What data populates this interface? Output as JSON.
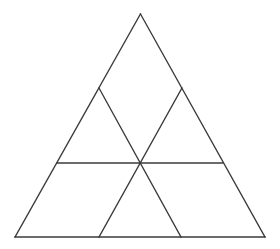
{
  "figure": {
    "background_color": "#ffffff",
    "line_color": "#3a3a3a",
    "line_width": 1.3,
    "canvas": {
      "width": 280,
      "height": 249
    },
    "points": {
      "apex": {
        "label": "A",
        "x": 140.5,
        "y": 14
      },
      "bottom_left": {
        "label": "B",
        "x": 15,
        "y": 237
      },
      "bottom_right": {
        "label": "C",
        "x": 265,
        "y": 237
      },
      "left_edge_upper": {
        "label": "D",
        "x": 99,
        "y": 88
      },
      "right_edge_upper": {
        "label": "E",
        "x": 182,
        "y": 88
      },
      "left_edge_mid": {
        "label": "F",
        "x": 57,
        "y": 163
      },
      "right_edge_mid": {
        "label": "G",
        "x": 223,
        "y": 163
      },
      "center": {
        "label": "H",
        "x": 141,
        "y": 163
      },
      "base_left_third": {
        "label": "I",
        "x": 99,
        "y": 237
      },
      "base_right_third": {
        "label": "J",
        "x": 181,
        "y": 237
      }
    },
    "outline": [
      {
        "name": "left-side",
        "from": "apex",
        "to": "bottom_left"
      },
      {
        "name": "right-side",
        "from": "apex",
        "to": "bottom_right"
      },
      {
        "name": "base",
        "from": "bottom_left",
        "to": "bottom_right"
      }
    ],
    "internal_lines": [
      {
        "name": "horizontal-midline",
        "from": "left_edge_mid",
        "to": "right_edge_mid"
      },
      {
        "name": "diagonal-left-down-right",
        "from": "left_edge_upper",
        "to": "base_right_third"
      },
      {
        "name": "diagonal-right-down-left",
        "from": "right_edge_upper",
        "to": "base_left_third"
      }
    ],
    "regions": [
      {
        "name": "top-triangle",
        "vertices": [
          "apex",
          "left_edge_upper",
          "right_edge_upper"
        ]
      },
      {
        "name": "upper-left-triangle",
        "vertices": [
          "left_edge_upper",
          "left_edge_mid",
          "center"
        ]
      },
      {
        "name": "upper-right-triangle",
        "vertices": [
          "right_edge_upper",
          "center",
          "right_edge_mid"
        ]
      },
      {
        "name": "lower-left-triangle",
        "vertices": [
          "left_edge_mid",
          "bottom_left",
          "base_left_third",
          "center"
        ]
      },
      {
        "name": "bottom-center-triangle",
        "vertices": [
          "center",
          "base_left_third",
          "base_right_third"
        ]
      },
      {
        "name": "lower-right-triangle",
        "vertices": [
          "center",
          "base_right_third",
          "bottom_right",
          "right_edge_mid"
        ]
      }
    ],
    "counts": {
      "small_triangles": 6,
      "vertices": 10,
      "segments": 6
    }
  }
}
